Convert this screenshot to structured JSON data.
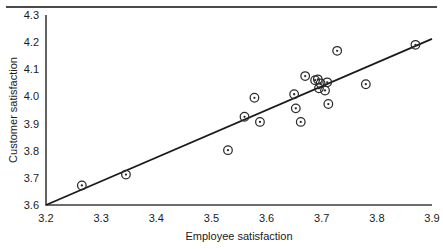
{
  "chart_data": {
    "type": "scatter",
    "title": "",
    "xlabel": "Employee satisfaction",
    "ylabel": "Customer satisfaction",
    "xlim": [
      3.2,
      3.9
    ],
    "ylim": [
      3.6,
      4.3
    ],
    "xticks": [
      "3.2",
      "3.3",
      "3.4",
      "3.5",
      "3.6",
      "3.7",
      "3.8",
      "3.9"
    ],
    "yticks": [
      "3.6",
      "3.7",
      "3.8",
      "3.9",
      "4.0",
      "4.1",
      "4.2",
      "4.3"
    ],
    "grid": false,
    "legend": null,
    "marker_style": "open-circle-with-center-dot",
    "points": [
      {
        "x": 3.265,
        "y": 3.672
      },
      {
        "x": 3.345,
        "y": 3.712
      },
      {
        "x": 3.53,
        "y": 3.802
      },
      {
        "x": 3.56,
        "y": 3.925
      },
      {
        "x": 3.578,
        "y": 3.995
      },
      {
        "x": 3.588,
        "y": 3.906
      },
      {
        "x": 3.65,
        "y": 4.008
      },
      {
        "x": 3.653,
        "y": 3.956
      },
      {
        "x": 3.662,
        "y": 3.906
      },
      {
        "x": 3.67,
        "y": 4.075
      },
      {
        "x": 3.688,
        "y": 4.06
      },
      {
        "x": 3.693,
        "y": 4.063
      },
      {
        "x": 3.695,
        "y": 4.03
      },
      {
        "x": 3.698,
        "y": 4.048
      },
      {
        "x": 3.706,
        "y": 4.022
      },
      {
        "x": 3.71,
        "y": 4.052
      },
      {
        "x": 3.712,
        "y": 3.972
      },
      {
        "x": 3.728,
        "y": 4.168
      },
      {
        "x": 3.78,
        "y": 4.045
      },
      {
        "x": 3.87,
        "y": 4.19
      }
    ],
    "fit_line": {
      "x0": 3.2,
      "y0": 3.6,
      "x1": 3.9,
      "y1": 4.212
    },
    "colors": {
      "marker": "#2b2b2b",
      "line": "#1a1a1a",
      "axis": "#3d3d3d",
      "text": "#1a1a1a",
      "background": "#ffffff"
    }
  }
}
